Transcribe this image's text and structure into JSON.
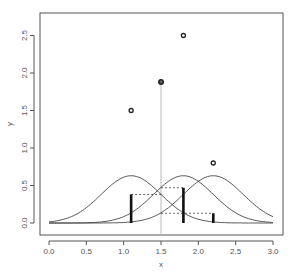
{
  "chart_data": {
    "type": "scatter",
    "title": "",
    "xlabel": "x",
    "ylabel": "y",
    "xlim": [
      -0.2,
      3.1
    ],
    "ylim": [
      -0.12,
      2.75
    ],
    "grid": false,
    "legend": null,
    "x_ticks": [
      "0.0",
      "0.5",
      "1.0",
      "1.5",
      "2.0",
      "2.5",
      "3.0"
    ],
    "x_tick_values": [
      0.0,
      0.5,
      1.0,
      1.5,
      2.0,
      2.5,
      3.0
    ],
    "y_ticks": [
      "0.0",
      "0.5",
      "1.0",
      "1.5",
      "2.0",
      "2.5"
    ],
    "y_tick_values": [
      0.0,
      0.5,
      1.0,
      1.5,
      2.0,
      2.5
    ],
    "points": [
      {
        "x": 1.1,
        "y": 1.5,
        "highlight": false
      },
      {
        "x": 1.5,
        "y": 1.88,
        "highlight": true
      },
      {
        "x": 1.8,
        "y": 2.5,
        "highlight": false
      },
      {
        "x": 2.2,
        "y": 0.8,
        "highlight": false
      }
    ],
    "kernel_curves": {
      "centers": [
        1.1,
        1.8,
        2.2
      ],
      "amplitude": 0.63,
      "sd": 0.4,
      "x_range": [
        0.0,
        3.0
      ]
    },
    "reference_x": 1.5,
    "weight_bars": [
      {
        "x": 1.1,
        "height": 0.38
      },
      {
        "x": 1.8,
        "height": 0.47
      },
      {
        "x": 2.2,
        "height": 0.13
      }
    ],
    "dashed_connectors": [
      {
        "from_x": 1.1,
        "to_x": 1.5,
        "y": 0.38
      },
      {
        "from_x": 1.5,
        "to_x": 1.8,
        "y": 0.47
      },
      {
        "from_x": 1.5,
        "to_x": 2.2,
        "y": 0.13
      }
    ]
  },
  "colors": {
    "axis": "#555555",
    "curve": "#444444",
    "bar": "#111111",
    "point": "#222222",
    "vline": "#bbbbbb",
    "dashed": "#444444"
  }
}
